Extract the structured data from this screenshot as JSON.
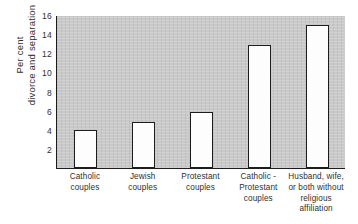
{
  "chart_data": {
    "type": "bar",
    "title": "",
    "xlabel": "",
    "ylabel": "Per cent divorce and separation",
    "ylabel_lines": [
      "Per cent",
      "divorce and separation"
    ],
    "categories": [
      "Catholic couples",
      "Jewish couples",
      "Protestant couples",
      "Catholic-Protestant couples",
      "Husband, wife, or both without religious affiliation"
    ],
    "category_lines": [
      [
        "Catholic",
        "couples"
      ],
      [
        "Jewish",
        "couples"
      ],
      [
        "Protestant",
        "couples"
      ],
      [
        "Catholic -",
        "Protestant",
        "couples"
      ],
      [
        "Husband, wife,",
        "or both without",
        "religious",
        "affiliation"
      ]
    ],
    "values": [
      4.0,
      4.8,
      5.9,
      12.9,
      15.0
    ],
    "ylim": [
      0,
      16
    ],
    "yticks": [
      2,
      4,
      6,
      8,
      10,
      12,
      14,
      16
    ],
    "ytick_labels": [
      "2",
      "4",
      "6",
      "8",
      "10",
      "12",
      "14",
      "16"
    ],
    "grid": false,
    "legend": "none",
    "colors": {
      "plot_background": "#c9c9c9",
      "bar_fill": "#fdfdfd",
      "bar_edge": "#1d1d1d",
      "axis": "#1d1d1d",
      "text": "#2f2f2f",
      "page_background": "#ffffff"
    }
  }
}
